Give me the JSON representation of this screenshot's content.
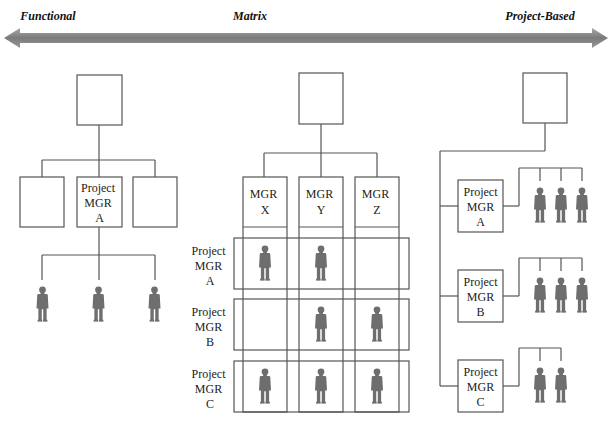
{
  "spectrum": {
    "left_label": "Functional",
    "center_label": "Matrix",
    "right_label": "Project-Based"
  },
  "functional": {
    "top_box": "",
    "boxes": [
      "",
      "Project\nMGR\nA",
      ""
    ],
    "manager_lines": [
      "Project",
      "MGR",
      "A"
    ],
    "people_count": 3
  },
  "matrix": {
    "top_box": "",
    "columns": [
      {
        "lines": [
          "MGR",
          "X"
        ]
      },
      {
        "lines": [
          "MGR",
          "Y"
        ]
      },
      {
        "lines": [
          "MGR",
          "Z"
        ]
      }
    ],
    "rows": [
      {
        "lines": [
          "Project",
          "MGR",
          "A"
        ],
        "assigned": [
          true,
          true,
          false
        ]
      },
      {
        "lines": [
          "Project",
          "MGR",
          "B"
        ],
        "assigned": [
          false,
          true,
          true
        ]
      },
      {
        "lines": [
          "Project",
          "MGR",
          "C"
        ],
        "assigned": [
          true,
          true,
          true
        ]
      }
    ]
  },
  "project_based": {
    "top_box": "",
    "projects": [
      {
        "lines": [
          "Project",
          "MGR",
          "A"
        ],
        "people_count": 3
      },
      {
        "lines": [
          "Project",
          "MGR",
          "B"
        ],
        "people_count": 3
      },
      {
        "lines": [
          "Project",
          "MGR",
          "C"
        ],
        "people_count": 2
      }
    ]
  },
  "colors": {
    "arrow": "#8a8a8a",
    "person": "#6e6e6e",
    "line": "#555555"
  }
}
